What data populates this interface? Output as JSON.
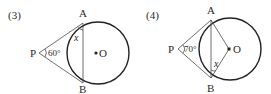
{
  "figures": [
    {
      "number_label": "(3)",
      "points": {
        "A": {
          "label": "A",
          "x": 83,
          "y": 23
        },
        "B": {
          "label": "B",
          "x": 83,
          "y": 83
        },
        "P": {
          "label": "P",
          "x": 39,
          "y": 53
        },
        "O": {
          "label": "O",
          "x": 98,
          "y": 53
        }
      },
      "circle": {
        "cx": 98,
        "cy": 53,
        "r": 31
      },
      "angle_label": "60°",
      "unknown_label": "x",
      "description": "PA and PB tangent to circle O at A and B; chord AB; angle APB = 60°; x is angle between tangent PA and chord AB at A"
    },
    {
      "number_label": "(4)",
      "points": {
        "A": {
          "label": "A",
          "x": 211,
          "y": 20
        },
        "B": {
          "label": "B",
          "x": 211,
          "y": 78
        },
        "P": {
          "label": "P",
          "x": 178,
          "y": 49
        },
        "O": {
          "label": "O",
          "x": 229,
          "y": 49
        }
      },
      "circle": {
        "cx": 230,
        "cy": 49,
        "r": 31
      },
      "angle_label": "70°",
      "unknown_label": "x",
      "description": "PA and PB tangent to circle O at A and B; chord AB; radii OA and OB; angle APB = 70°; x is angle ABO"
    }
  ]
}
